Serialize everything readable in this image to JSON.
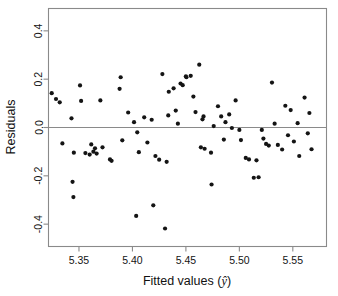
{
  "chart_data": {
    "type": "scatter",
    "title": "",
    "subtitle": "",
    "xlabel": "Fitted values (ŷ)",
    "ylabel": "Residuals",
    "xlabel_prefix": "Fitted values (",
    "xlabel_symbol": "ŷ",
    "xlabel_suffix": ")",
    "xlim": [
      5.3215,
      5.5815
    ],
    "ylim": [
      -0.4925,
      0.4925
    ],
    "xticks": [
      5.35,
      5.4,
      5.45,
      5.5,
      5.55
    ],
    "xtick_labels": [
      "5.35",
      "5.40",
      "5.45",
      "5.50",
      "5.55"
    ],
    "yticks": [
      0.4,
      0.2,
      0.0,
      -0.2,
      -0.4
    ],
    "ytick_labels": [
      "0.4",
      "0.2",
      "0.0",
      "-0.2",
      "-0.4"
    ],
    "grid": false,
    "legend": null,
    "reference_lines": [
      {
        "name": "zero-residual-line",
        "orientation": "horizontal",
        "y": 0.0,
        "color": "#8a8a8a"
      }
    ],
    "marker": {
      "shape": "circle",
      "color": "#141414",
      "size": 2.1
    },
    "frame_color": "#8a8a8a",
    "n_points": 85,
    "x": [
      5.3245,
      5.3285,
      5.332,
      5.3345,
      5.343,
      5.344,
      5.3448,
      5.3452,
      5.351,
      5.352,
      5.356,
      5.36,
      5.3615,
      5.3635,
      5.365,
      5.3665,
      5.37,
      5.372,
      5.379,
      5.3805,
      5.388,
      5.389,
      5.3905,
      5.396,
      5.4015,
      5.4035,
      5.4045,
      5.406,
      5.411,
      5.414,
      5.418,
      5.4195,
      5.4215,
      5.425,
      5.428,
      5.4305,
      5.432,
      5.4335,
      5.434,
      5.4385,
      5.4405,
      5.4425,
      5.445,
      5.447,
      5.45,
      5.4505,
      5.4545,
      5.457,
      5.459,
      5.4625,
      5.464,
      5.4655,
      5.4665,
      5.4675,
      5.4735,
      5.474,
      5.476,
      5.48,
      5.483,
      5.4855,
      5.487,
      5.4905,
      5.493,
      5.4965,
      5.5,
      5.5015,
      5.506,
      5.509,
      5.5135,
      5.516,
      5.518,
      5.521,
      5.5225,
      5.525,
      5.5275,
      5.5305,
      5.533,
      5.536,
      5.54,
      5.543,
      5.5455,
      5.548,
      5.551,
      5.5545,
      5.556,
      5.561,
      5.564,
      5.5655,
      5.5675
    ],
    "y": [
      0.142,
      0.118,
      0.104,
      -0.066,
      0.038,
      -0.225,
      -0.288,
      -0.104,
      0.174,
      0.11,
      -0.106,
      -0.112,
      -0.07,
      -0.1,
      -0.086,
      -0.108,
      0.112,
      -0.082,
      -0.132,
      -0.138,
      0.16,
      0.208,
      -0.053,
      0.062,
      0.022,
      -0.366,
      -0.02,
      -0.102,
      0.042,
      -0.062,
      0.032,
      -0.322,
      -0.118,
      -0.133,
      0.221,
      -0.418,
      -0.142,
      0.05,
      0.148,
      0.162,
      0.07,
      0.016,
      0.182,
      0.175,
      0.212,
      0.208,
      0.214,
      0.128,
      0.064,
      0.26,
      -0.082,
      0.034,
      0.046,
      -0.088,
      -0.104,
      -0.236,
      0.006,
      0.088,
      0.046,
      -0.05,
      0.022,
      0.054,
      -0.002,
      0.112,
      -0.01,
      -0.052,
      -0.126,
      -0.132,
      -0.208,
      -0.136,
      -0.206,
      -0.01,
      -0.046,
      -0.068,
      -0.075,
      0.186,
      0.016,
      -0.072,
      -0.091,
      0.09,
      -0.032,
      0.072,
      -0.058,
      0.018,
      -0.118,
      0.124,
      -0.024,
      0.06,
      -0.09
    ]
  }
}
